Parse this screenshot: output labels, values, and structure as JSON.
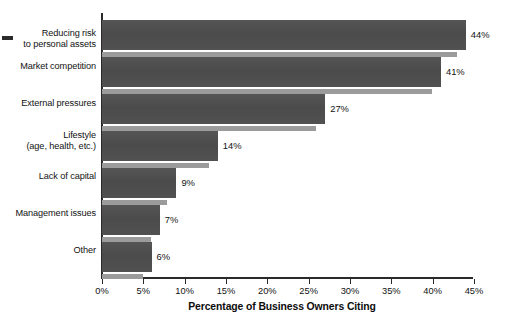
{
  "chart_data": {
    "type": "bar",
    "orientation": "horizontal",
    "title": "",
    "xlabel": "Percentage of Business Owners Citing",
    "ylabel": "",
    "xlim": [
      0,
      45
    ],
    "grid": false,
    "legend": null,
    "categories": [
      "Reducing risk\nto personal assets",
      "Market competition",
      "External pressures",
      "Lifestyle\n(age, health, etc.)",
      "Lack of capital",
      "Management issues",
      "Other"
    ],
    "values": [
      44,
      41,
      27,
      14,
      9,
      7,
      6
    ],
    "value_labels": [
      "44%",
      "41%",
      "27%",
      "14%",
      "9%",
      "7%",
      "6%"
    ],
    "xticks": [
      0,
      5,
      10,
      15,
      20,
      25,
      30,
      35,
      40,
      45
    ],
    "xtick_labels": [
      "0%",
      "5%",
      "10%",
      "15%",
      "20%",
      "25%",
      "30%",
      "35%",
      "40%",
      "45%"
    ],
    "bar_color": "#4e4e4e",
    "bar_shadow_color": "#9b9b9b",
    "axis_color": "#2a2a2a",
    "background_color": "#ffffff"
  },
  "categories_display": [
    {
      "line1": "Reducing risk",
      "line2": "to personal assets"
    },
    {
      "line1": "Market competition",
      "line2": ""
    },
    {
      "line1": "External pressures",
      "line2": ""
    },
    {
      "line1": "Lifestyle",
      "line2": "(age, health, etc.)"
    },
    {
      "line1": "Lack of capital",
      "line2": ""
    },
    {
      "line1": "Management issues",
      "line2": ""
    },
    {
      "line1": "Other",
      "line2": ""
    }
  ]
}
